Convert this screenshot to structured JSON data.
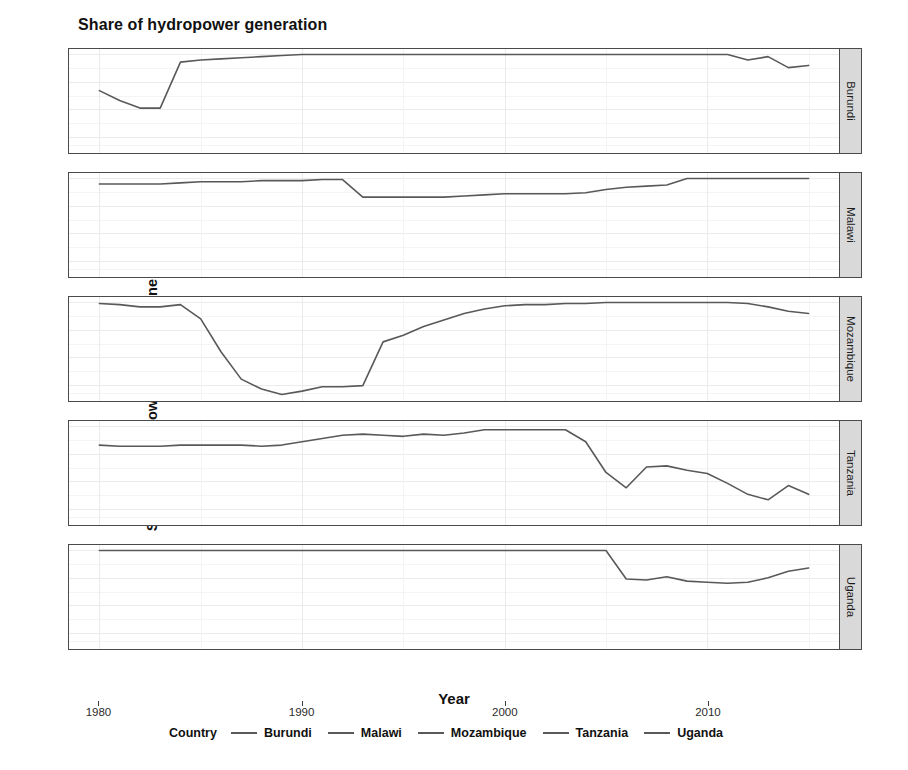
{
  "title": "Share of hydropower generation",
  "axes": {
    "x_label": "Year",
    "y_label": "Share of hydropower over total generation",
    "y_ticks": [
      "1.00",
      "0.75",
      "0.50",
      "0.25"
    ],
    "x_ticks": [
      "1980",
      "1990",
      "2000",
      "2010"
    ]
  },
  "legend": {
    "title": "Country",
    "items": [
      {
        "label": "Burundi",
        "color": "#595959"
      },
      {
        "label": "Malawi",
        "color": "#595959"
      },
      {
        "label": "Mozambique",
        "color": "#595959"
      },
      {
        "label": "Tanzania",
        "color": "#595959"
      },
      {
        "label": "Uganda",
        "color": "#595959"
      }
    ]
  },
  "facets": [
    {
      "label": "Burundi"
    },
    {
      "label": "Malawi"
    },
    {
      "label": "Mozambique"
    },
    {
      "label": "Tanzania"
    },
    {
      "label": "Uganda"
    }
  ],
  "chart_data": {
    "type": "line",
    "title": "Share of hydropower generation",
    "xlabel": "Year",
    "ylabel": "Share of hydropower over total generation",
    "xlim": [
      1978.5,
      2016.5
    ],
    "ylim": [
      0.1,
      1.05
    ],
    "y_ticks": [
      1.0,
      0.75,
      0.5,
      0.25
    ],
    "x_ticks": [
      1980,
      1990,
      2000,
      2010
    ],
    "grid": true,
    "legend_position": "bottom",
    "facet_by": "Country",
    "x": [
      1980,
      1981,
      1982,
      1983,
      1984,
      1985,
      1986,
      1987,
      1988,
      1989,
      1990,
      1991,
      1992,
      1993,
      1994,
      1995,
      1996,
      1997,
      1998,
      1999,
      2000,
      2001,
      2002,
      2003,
      2004,
      2005,
      2006,
      2007,
      2008,
      2009,
      2010,
      2011,
      2012,
      2013,
      2014,
      2015
    ],
    "series": [
      {
        "name": "Burundi",
        "values": [
          0.67,
          0.58,
          0.51,
          0.51,
          0.93,
          0.95,
          0.96,
          0.97,
          0.98,
          0.99,
          1.0,
          1.0,
          1.0,
          1.0,
          1.0,
          1.0,
          1.0,
          1.0,
          1.0,
          1.0,
          1.0,
          1.0,
          1.0,
          1.0,
          1.0,
          1.0,
          1.0,
          1.0,
          1.0,
          1.0,
          1.0,
          1.0,
          0.95,
          0.98,
          0.88,
          0.9
        ]
      },
      {
        "name": "Malawi",
        "values": [
          0.95,
          0.95,
          0.95,
          0.95,
          0.96,
          0.97,
          0.97,
          0.97,
          0.98,
          0.98,
          0.98,
          0.99,
          0.99,
          0.83,
          0.83,
          0.83,
          0.83,
          0.83,
          0.84,
          0.85,
          0.86,
          0.86,
          0.86,
          0.86,
          0.87,
          0.9,
          0.92,
          0.93,
          0.94,
          1.0,
          1.0,
          1.0,
          1.0,
          1.0,
          1.0,
          1.0
        ]
      },
      {
        "name": "Mozambique",
        "values": [
          0.99,
          0.98,
          0.96,
          0.96,
          0.98,
          0.85,
          0.55,
          0.3,
          0.21,
          0.16,
          0.19,
          0.23,
          0.23,
          0.24,
          0.64,
          0.7,
          0.78,
          0.84,
          0.9,
          0.94,
          0.97,
          0.98,
          0.98,
          0.99,
          0.99,
          1.0,
          1.0,
          1.0,
          1.0,
          1.0,
          1.0,
          1.0,
          0.99,
          0.96,
          0.92,
          0.9
        ]
      },
      {
        "name": "Tanzania",
        "values": [
          0.83,
          0.82,
          0.82,
          0.82,
          0.83,
          0.83,
          0.83,
          0.83,
          0.82,
          0.83,
          0.86,
          0.89,
          0.92,
          0.93,
          0.92,
          0.91,
          0.93,
          0.92,
          0.94,
          0.97,
          0.97,
          0.97,
          0.97,
          0.97,
          0.86,
          0.58,
          0.44,
          0.63,
          0.64,
          0.6,
          0.57,
          0.48,
          0.38,
          0.33,
          0.46,
          0.38
        ]
      },
      {
        "name": "Uganda",
        "values": [
          1.0,
          1.0,
          1.0,
          1.0,
          1.0,
          1.0,
          1.0,
          1.0,
          1.0,
          1.0,
          1.0,
          1.0,
          1.0,
          1.0,
          1.0,
          1.0,
          1.0,
          1.0,
          1.0,
          1.0,
          1.0,
          1.0,
          1.0,
          1.0,
          1.0,
          1.0,
          0.74,
          0.73,
          0.76,
          0.72,
          0.71,
          0.7,
          0.71,
          0.75,
          0.81,
          0.84
        ]
      }
    ]
  }
}
